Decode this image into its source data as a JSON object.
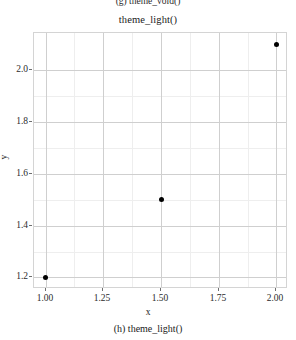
{
  "figure": {
    "top_caption_clipped": "(g) theme_void()",
    "bottom_caption": "(h) theme_light()"
  },
  "chart_data": {
    "type": "scatter",
    "title": "theme_light()",
    "xlabel": "x",
    "ylabel": "y",
    "x": [
      1.0,
      1.5,
      2.0
    ],
    "y": [
      1.2,
      1.5,
      2.1
    ],
    "points": [
      {
        "x": 1.0,
        "y": 1.2
      },
      {
        "x": 1.5,
        "y": 1.5
      },
      {
        "x": 2.0,
        "y": 2.1
      }
    ],
    "xlim": [
      0.95,
      2.05
    ],
    "ylim": [
      1.155,
      2.145
    ],
    "xticks": [
      1.0,
      1.25,
      1.5,
      1.75,
      2.0
    ],
    "xticklabels": [
      "1.00",
      "1.25",
      "1.50",
      "1.75",
      "2.00"
    ],
    "yticks": [
      1.2,
      1.4,
      1.6,
      1.8,
      2.0
    ],
    "yticklabels": [
      "1.2",
      "1.4",
      "1.6",
      "1.8",
      "2.0"
    ],
    "xminorticks": [
      1.125,
      1.375,
      1.625,
      1.875
    ],
    "yminorticks": [
      1.3,
      1.5,
      1.7,
      1.9
    ],
    "grid": true,
    "legend": null,
    "point_color": "#000000",
    "panel_border_color": "#d4d4d4",
    "grid_major_color": "#cfcfcf",
    "grid_minor_color": "#eeeeee",
    "background": "#ffffff"
  }
}
